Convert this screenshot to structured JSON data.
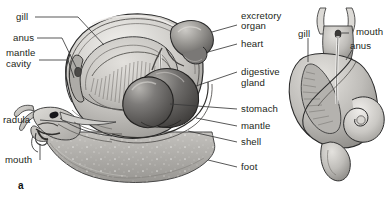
{
  "figure": {
    "panel_label": "a",
    "ink_color": "#231f20",
    "background_color": "#ffffff"
  },
  "left_labels": [
    {
      "id": "gill",
      "text": "gill",
      "x": 16,
      "y": 12
    },
    {
      "id": "anus",
      "text": "anus",
      "x": 13,
      "y": 33
    },
    {
      "id": "mantle",
      "text": "mantle",
      "x": 6,
      "y": 48
    },
    {
      "id": "mantle-cavity",
      "text": "cavity",
      "x": 6,
      "y": 59
    },
    {
      "id": "radula",
      "text": "radula",
      "x": 3,
      "y": 117
    },
    {
      "id": "mouth",
      "text": "mouth",
      "x": 5,
      "y": 161
    }
  ],
  "right_labels": [
    {
      "id": "excretory-organ-1",
      "text": "excretory",
      "x": 241,
      "y": 11
    },
    {
      "id": "excretory-organ-2",
      "text": "organ",
      "x": 241,
      "y": 21
    },
    {
      "id": "heart",
      "text": "heart",
      "x": 241,
      "y": 40
    },
    {
      "id": "digestive-gland-1",
      "text": "digestive",
      "x": 241,
      "y": 68
    },
    {
      "id": "digestive-gland-2",
      "text": "gland",
      "x": 241,
      "y": 79
    },
    {
      "id": "stomach",
      "text": "stomach",
      "x": 241,
      "y": 105
    },
    {
      "id": "mantle",
      "text": "mantle",
      "x": 241,
      "y": 122
    },
    {
      "id": "shell",
      "text": "shell",
      "x": 241,
      "y": 138
    },
    {
      "id": "foot",
      "text": "foot",
      "x": 241,
      "y": 163
    }
  ],
  "inset_labels": [
    {
      "id": "gill",
      "text": "gill",
      "x": 298,
      "y": 29
    },
    {
      "id": "mouth",
      "text": "mouth",
      "x": 352,
      "y": 29
    },
    {
      "id": "anus",
      "text": "anus",
      "x": 347,
      "y": 43
    }
  ],
  "structures": {
    "main_view": [
      "shell",
      "mantle",
      "mantle cavity",
      "gill",
      "anus",
      "excretory organ",
      "heart",
      "digestive gland",
      "stomach",
      "foot",
      "head",
      "tentacles",
      "eye",
      "radula",
      "mouth"
    ],
    "inset_view": [
      "gill",
      "mouth",
      "anus",
      "shell spiral",
      "tentacles",
      "foot"
    ]
  },
  "palette": {
    "outline": "#2b2b2b",
    "shell_light": "#e8e6e2",
    "shell_mid": "#bdbcb8",
    "shell_dark": "#8d8c88",
    "organ_dark": "#6e6c6a",
    "organ_darkest": "#4a4846",
    "foot_gray": "#b6b4b0",
    "mantle_gray": "#cfcecb",
    "leader_line": "#3a3a3a"
  }
}
